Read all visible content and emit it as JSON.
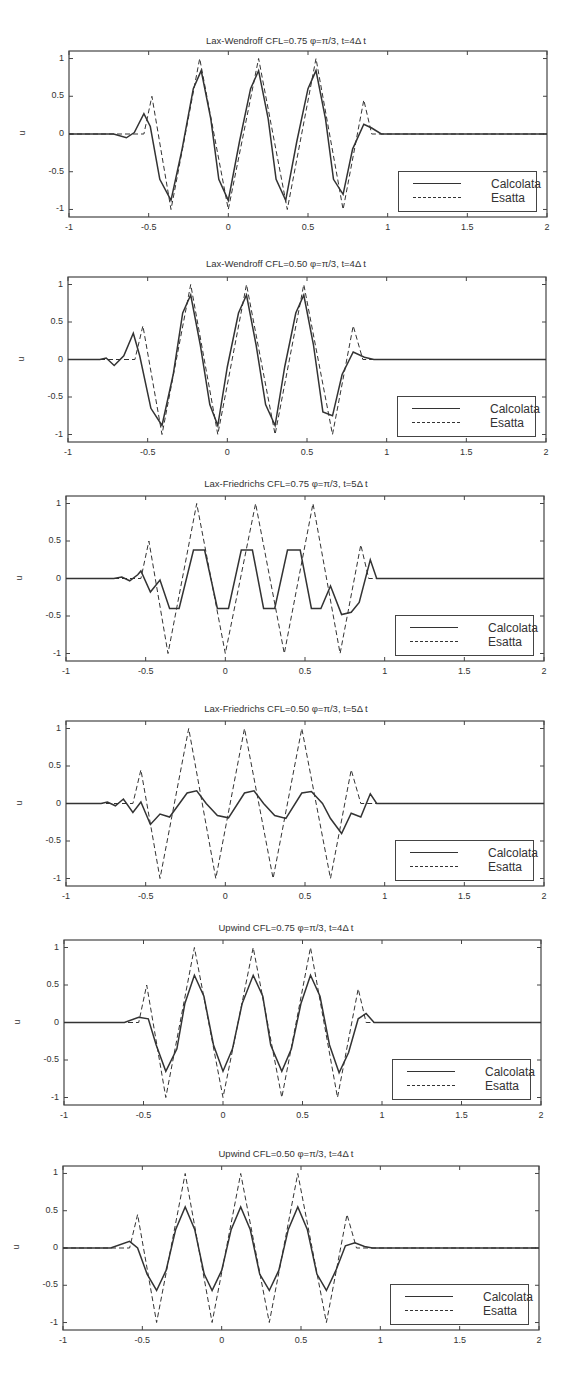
{
  "figure": {
    "background": "#ffffff",
    "line_color": "#333333"
  },
  "axes_common": {
    "xlim": [
      -1,
      2
    ],
    "ylim": [
      -1.1,
      1.1
    ],
    "ylabel": "u",
    "xticks": [
      "-1",
      "-0.5",
      "0",
      "0.5",
      "1",
      "1.5",
      "2"
    ],
    "yticks": [
      "1",
      "0.5",
      "0",
      "-0.5",
      "-1"
    ],
    "legend": [
      "Calcolata",
      "Esatta"
    ]
  },
  "panels": [
    {
      "title": "Lax-Wendroff CFL=0.75 φ=π/3, t=4Δ t"
    },
    {
      "title": "Lax-Wendroff CFL=0.50 φ=π/3, t=4Δ t"
    },
    {
      "title": "Lax-Friedrichs CFL=0.75 φ=π/3, t=5Δ t"
    },
    {
      "title": "Lax-Friedrichs CFL=0.50 φ=π/3, t=5Δ t"
    },
    {
      "title": "Upwind CFL=0.75 φ=π/3, t=4Δ t"
    },
    {
      "title": "Upwind CFL=0.50 φ=π/3, t=4Δ t"
    }
  ],
  "chart_data": [
    {
      "type": "line",
      "title": "Lax-Wendroff CFL=0.75 φ=π/3, t=4Δ t",
      "xlabel": "",
      "ylabel": "u",
      "xlim": [
        -1,
        2
      ],
      "ylim": [
        -1.1,
        1.1
      ],
      "legend_position": "lower right",
      "series": [
        {
          "name": "Calcolata",
          "style": "solid",
          "x": [
            -1,
            -0.72,
            -0.64,
            -0.59,
            -0.53,
            -0.49,
            -0.43,
            -0.36,
            -0.29,
            -0.22,
            -0.17,
            -0.11,
            -0.06,
            0.0,
            0.07,
            0.14,
            0.19,
            0.25,
            0.3,
            0.36,
            0.43,
            0.5,
            0.55,
            0.61,
            0.66,
            0.72,
            0.78,
            0.85,
            0.9,
            0.96,
            2
          ],
          "y": [
            0,
            0,
            -0.05,
            0.02,
            0.27,
            0.1,
            -0.6,
            -0.88,
            -0.2,
            0.6,
            0.84,
            0.2,
            -0.6,
            -0.88,
            -0.1,
            0.6,
            0.84,
            0.2,
            -0.6,
            -0.88,
            -0.1,
            0.6,
            0.84,
            0.2,
            -0.6,
            -0.8,
            -0.2,
            0.13,
            0.08,
            0.0,
            0.0
          ]
        },
        {
          "name": "Esatta",
          "style": "dashed",
          "x": [
            -1,
            -0.53,
            -0.48,
            -0.36,
            -0.18,
            0.0,
            0.19,
            0.37,
            0.55,
            0.72,
            0.85,
            0.9,
            2
          ],
          "y": [
            0,
            0,
            0.5,
            -1,
            1,
            -1,
            1,
            -1,
            1,
            -1,
            0.45,
            0,
            0
          ]
        }
      ]
    },
    {
      "type": "line",
      "title": "Lax-Wendroff CFL=0.50 φ=π/3, t=4Δ t",
      "xlabel": "",
      "ylabel": "u",
      "xlim": [
        -1,
        2
      ],
      "ylim": [
        -1.1,
        1.1
      ],
      "legend_position": "lower right",
      "series": [
        {
          "name": "Calcolata",
          "style": "solid",
          "x": [
            -1,
            -0.8,
            -0.76,
            -0.71,
            -0.65,
            -0.59,
            -0.55,
            -0.48,
            -0.41,
            -0.34,
            -0.28,
            -0.23,
            -0.17,
            -0.11,
            -0.06,
            0.0,
            0.07,
            0.12,
            0.18,
            0.24,
            0.3,
            0.36,
            0.43,
            0.48,
            0.54,
            0.6,
            0.66,
            0.72,
            0.79,
            0.86,
            0.92,
            2
          ],
          "y": [
            0,
            0,
            0.02,
            -0.08,
            0.05,
            0.35,
            0.05,
            -0.65,
            -0.88,
            -0.2,
            0.62,
            0.86,
            0.2,
            -0.6,
            -0.88,
            -0.1,
            0.62,
            0.86,
            0.2,
            -0.6,
            -0.88,
            -0.1,
            0.62,
            0.86,
            0.2,
            -0.7,
            -0.75,
            -0.2,
            0.1,
            0.03,
            0.0,
            0.0
          ]
        },
        {
          "name": "Esatta",
          "style": "dashed",
          "x": [
            -1,
            -0.58,
            -0.53,
            -0.41,
            -0.23,
            -0.06,
            0.12,
            0.3,
            0.48,
            0.66,
            0.79,
            0.85,
            2
          ],
          "y": [
            0,
            0,
            0.45,
            -1,
            1,
            -1,
            1,
            -1,
            1,
            -1,
            0.45,
            0,
            0
          ]
        }
      ]
    },
    {
      "type": "line",
      "title": "Lax-Friedrichs CFL=0.75 φ=π/3, t=5Δ t",
      "xlabel": "",
      "ylabel": "u",
      "xlim": [
        -1,
        2
      ],
      "ylim": [
        -1.1,
        1.1
      ],
      "legend_position": "lower right",
      "series": [
        {
          "name": "Calcolata",
          "style": "solid",
          "x": [
            -1,
            -0.7,
            -0.65,
            -0.6,
            -0.55,
            -0.53,
            -0.47,
            -0.41,
            -0.35,
            -0.29,
            -0.2,
            -0.13,
            -0.05,
            0.02,
            0.1,
            0.17,
            0.24,
            0.31,
            0.39,
            0.47,
            0.54,
            0.6,
            0.66,
            0.73,
            0.79,
            0.84,
            0.91,
            0.95,
            2
          ],
          "y": [
            0,
            0,
            0.02,
            -0.03,
            0.05,
            0.1,
            -0.18,
            -0.02,
            -0.4,
            -0.4,
            0.38,
            0.38,
            -0.4,
            -0.4,
            0.38,
            0.38,
            -0.4,
            -0.4,
            0.38,
            0.38,
            -0.4,
            -0.4,
            -0.1,
            -0.48,
            -0.45,
            -0.32,
            0.25,
            0.0,
            0.0
          ]
        },
        {
          "name": "Esatta",
          "style": "dashed",
          "x": [
            -1,
            -0.53,
            -0.48,
            -0.36,
            -0.18,
            0.0,
            0.19,
            0.37,
            0.55,
            0.72,
            0.85,
            0.9,
            2
          ],
          "y": [
            0,
            0,
            0.5,
            -1,
            1,
            -1,
            1,
            -1,
            1,
            -1,
            0.45,
            0,
            0
          ]
        }
      ]
    },
    {
      "type": "line",
      "title": "Lax-Friedrichs CFL=0.50 φ=π/3, t=5Δ t",
      "xlabel": "",
      "ylabel": "u",
      "xlim": [
        -1,
        2
      ],
      "ylim": [
        -1.1,
        1.1
      ],
      "legend_position": "lower right",
      "series": [
        {
          "name": "Calcolata",
          "style": "solid",
          "x": [
            -1,
            -0.78,
            -0.74,
            -0.69,
            -0.64,
            -0.58,
            -0.53,
            -0.47,
            -0.41,
            -0.35,
            -0.24,
            -0.18,
            -0.12,
            -0.05,
            0.02,
            0.12,
            0.18,
            0.24,
            0.31,
            0.38,
            0.48,
            0.54,
            0.61,
            0.66,
            0.73,
            0.79,
            0.85,
            0.91,
            0.95,
            2
          ],
          "y": [
            0,
            0,
            0.02,
            -0.03,
            0.06,
            -0.12,
            0.02,
            -0.28,
            -0.14,
            -0.18,
            0.14,
            0.17,
            0.0,
            -0.16,
            -0.19,
            0.14,
            0.17,
            0.0,
            -0.16,
            -0.2,
            0.14,
            0.16,
            0.0,
            -0.2,
            -0.4,
            -0.13,
            -0.18,
            0.13,
            0.0,
            0.0
          ]
        },
        {
          "name": "Esatta",
          "style": "dashed",
          "x": [
            -1,
            -0.58,
            -0.53,
            -0.41,
            -0.23,
            -0.06,
            0.12,
            0.3,
            0.48,
            0.66,
            0.79,
            0.85,
            2
          ],
          "y": [
            0,
            0,
            0.45,
            -1,
            1,
            -1,
            1,
            -1,
            1,
            -1,
            0.45,
            0,
            0
          ]
        }
      ]
    },
    {
      "type": "line",
      "title": "Upwind CFL=0.75 φ=π/3, t=4Δ t",
      "xlabel": "",
      "ylabel": "u",
      "xlim": [
        -1,
        2
      ],
      "ylim": [
        -1.1,
        1.1
      ],
      "legend_position": "lower right",
      "series": [
        {
          "name": "Calcolata",
          "style": "solid",
          "x": [
            -1,
            -0.62,
            -0.53,
            -0.47,
            -0.42,
            -0.36,
            -0.29,
            -0.24,
            -0.18,
            -0.12,
            -0.06,
            0.0,
            0.06,
            0.12,
            0.19,
            0.25,
            0.3,
            0.37,
            0.43,
            0.49,
            0.55,
            0.61,
            0.67,
            0.73,
            0.79,
            0.85,
            0.9,
            0.95,
            2
          ],
          "y": [
            0,
            0,
            0.07,
            0.05,
            -0.3,
            -0.65,
            -0.35,
            0.25,
            0.63,
            0.35,
            -0.3,
            -0.65,
            -0.35,
            0.25,
            0.63,
            0.35,
            -0.3,
            -0.65,
            -0.35,
            0.25,
            0.63,
            0.35,
            -0.3,
            -0.67,
            -0.4,
            0.05,
            0.12,
            0.0,
            0.0
          ]
        },
        {
          "name": "Esatta",
          "style": "dashed",
          "x": [
            -1,
            -0.53,
            -0.48,
            -0.36,
            -0.18,
            0.0,
            0.19,
            0.37,
            0.55,
            0.72,
            0.85,
            0.9,
            2
          ],
          "y": [
            0,
            0,
            0.5,
            -1,
            1,
            -1,
            1,
            -1,
            1,
            -1,
            0.45,
            0,
            0
          ]
        }
      ]
    },
    {
      "type": "line",
      "title": "Upwind CFL=0.50 φ=π/3, t=4Δ t",
      "xlabel": "",
      "ylabel": "u",
      "xlim": [
        -1,
        2
      ],
      "ylim": [
        -1.1,
        1.1
      ],
      "legend_position": "lower right",
      "series": [
        {
          "name": "Calcolata",
          "style": "solid",
          "x": [
            -1,
            -0.7,
            -0.58,
            -0.53,
            -0.47,
            -0.41,
            -0.35,
            -0.29,
            -0.23,
            -0.17,
            -0.11,
            -0.06,
            0.0,
            0.06,
            0.12,
            0.18,
            0.24,
            0.3,
            0.36,
            0.42,
            0.48,
            0.54,
            0.6,
            0.66,
            0.72,
            0.78,
            0.84,
            0.9,
            0.95,
            2
          ],
          "y": [
            0,
            0,
            0.09,
            0.0,
            -0.35,
            -0.57,
            -0.3,
            0.25,
            0.55,
            0.25,
            -0.35,
            -0.57,
            -0.3,
            0.25,
            0.55,
            0.25,
            -0.35,
            -0.57,
            -0.3,
            0.25,
            0.55,
            0.25,
            -0.35,
            -0.57,
            -0.3,
            0.03,
            0.07,
            0.02,
            0.0,
            0.0
          ]
        },
        {
          "name": "Esatta",
          "style": "dashed",
          "x": [
            -1,
            -0.58,
            -0.53,
            -0.41,
            -0.23,
            -0.06,
            0.12,
            0.3,
            0.48,
            0.66,
            0.79,
            0.85,
            2
          ],
          "y": [
            0,
            0,
            0.45,
            -1,
            1,
            -1,
            1,
            -1,
            1,
            -1,
            0.45,
            0,
            0
          ]
        }
      ]
    }
  ]
}
